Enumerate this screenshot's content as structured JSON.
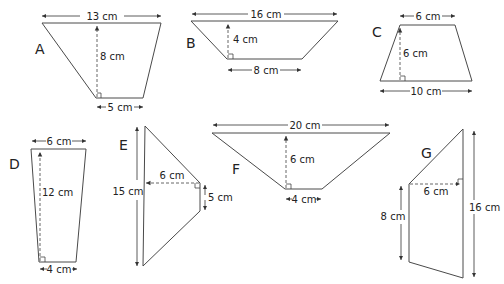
{
  "unit": "cm",
  "shapes": {
    "A": {
      "letter": "A",
      "top": "13 cm",
      "height": "8 cm",
      "bottom": "5 cm"
    },
    "B": {
      "letter": "B",
      "top": "16 cm",
      "height": "4 cm",
      "bottom": "8 cm"
    },
    "C": {
      "letter": "C",
      "top": "6 cm",
      "height": "6 cm",
      "bottom": "10 cm"
    },
    "D": {
      "letter": "D",
      "top": "6 cm",
      "height": "12 cm",
      "bottom": "4 cm"
    },
    "E": {
      "letter": "E",
      "long_side": "15 cm",
      "height": "6 cm",
      "short_side": "5 cm"
    },
    "F": {
      "letter": "F",
      "top": "20 cm",
      "height": "6 cm",
      "bottom": "4 cm"
    },
    "G": {
      "letter": "G",
      "long_side": "16 cm",
      "height": "6 cm",
      "short_side": "8 cm"
    }
  },
  "colors": {
    "line": "#4a4a4a",
    "text": "#222222",
    "background": "#ffffff"
  }
}
